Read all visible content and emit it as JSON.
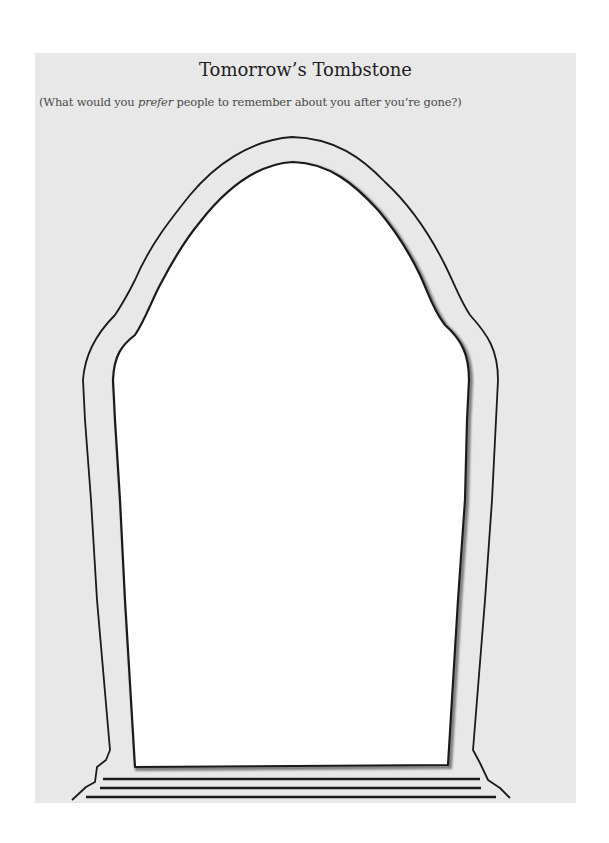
{
  "worksheet": {
    "title": "Tomorrow’s Tombstone",
    "subtitle": {
      "prefix": "(What would you ",
      "emphasis": "prefer",
      "suffix": " people to remember about you after you’re gone?)"
    }
  },
  "tombstone": {
    "writing_area": "",
    "colors": {
      "panel_background": "#e8e8e8",
      "stone_face": "#ffffff",
      "outline": "#1a1a1a",
      "shadow": "#8a8a8a"
    },
    "base_steps": 3
  }
}
